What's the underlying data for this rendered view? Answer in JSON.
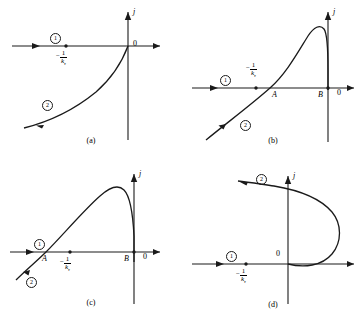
{
  "figure": {
    "axis_label_j": "j",
    "origin_label": "0",
    "branch_one": "①",
    "branch_two": "②",
    "tick_minus": "−",
    "tick_numerator": "1",
    "tick_denominator": "k",
    "tick_subscript": "τ",
    "point_a": "A",
    "point_b": "B",
    "line_color": "#1a1a1a",
    "background": "#ffffff"
  },
  "panels": [
    {
      "id": "a",
      "caption": "(a)",
      "curve_type": "monotonic-rise",
      "has_point_a": false,
      "has_point_b": false,
      "tick_label_position": "below"
    },
    {
      "id": "b",
      "caption": "(b)",
      "curve_type": "n-shaped-peak",
      "has_point_a": true,
      "has_point_b": true,
      "tick_label_position": "above"
    },
    {
      "id": "c",
      "caption": "(c)",
      "curve_type": "n-shaped-peak",
      "has_point_a": true,
      "has_point_b": true,
      "tick_label_position": "below"
    },
    {
      "id": "d",
      "caption": "(d)",
      "curve_type": "c-shaped-loop",
      "has_point_a": false,
      "has_point_b": false,
      "tick_label_position": "below"
    }
  ],
  "chart_data": {
    "type": "line",
    "title": "",
    "xlabel": "",
    "ylabel": "j",
    "grid": false,
    "legend": "none",
    "panels": [
      {
        "id": "a",
        "caption": "(a)",
        "description": "Current density rises monotonically from lower-left, approaching zero at the origin.",
        "branches": [
          {
            "name": "①",
            "kind": "horizontal-axis-branch",
            "points": [
              [
                -1.0,
                0.0
              ],
              [
                0.0,
                0.0
              ]
            ],
            "arrow_at": [
              -0.72,
              0.0
            ]
          },
          {
            "name": "②",
            "kind": "curve",
            "points": [
              [
                -0.93,
                -0.74
              ],
              [
                -0.78,
                -0.62
              ],
              [
                -0.6,
                -0.5
              ],
              [
                -0.42,
                -0.38
              ],
              [
                -0.26,
                -0.26
              ],
              [
                -0.13,
                -0.14
              ],
              [
                -0.05,
                -0.05
              ],
              [
                0.0,
                0.0
              ]
            ],
            "arrow_at": [
              -0.72,
              -0.58
            ]
          }
        ],
        "markers": [
          {
            "label": "−1/kτ",
            "x": -0.45,
            "y": 0.0,
            "position": "below"
          },
          {
            "label": "0",
            "x": 0.0,
            "y": 0.0,
            "position": "right"
          }
        ]
      },
      {
        "id": "b",
        "caption": "(b)",
        "description": "N-shaped curve crossing the axis at A, peaking, then dropping steeply to B near the origin.",
        "branches": [
          {
            "name": "①",
            "kind": "horizontal-axis-branch",
            "points": [
              [
                -1.0,
                0.0
              ],
              [
                0.0,
                0.0
              ]
            ],
            "arrow_at": [
              -0.8,
              0.0
            ]
          },
          {
            "name": "②",
            "kind": "curve",
            "points": [
              [
                -0.95,
                -0.72
              ],
              [
                -0.78,
                -0.55
              ],
              [
                -0.6,
                -0.36
              ],
              [
                -0.46,
                -0.18
              ],
              [
                -0.36,
                0.0
              ],
              [
                -0.22,
                0.3
              ],
              [
                -0.12,
                0.62
              ],
              [
                -0.05,
                0.82
              ],
              [
                0.0,
                0.88
              ],
              [
                0.04,
                0.84
              ],
              [
                0.07,
                0.6
              ],
              [
                0.08,
                0.22
              ],
              [
                0.08,
                0.0
              ]
            ],
            "arrow_at": [
              -0.72,
              -0.48
            ]
          }
        ],
        "markers": [
          {
            "label": "−1/kτ",
            "x": -0.52,
            "y": 0.0,
            "position": "above"
          },
          {
            "label": "A",
            "x": -0.36,
            "y": 0.0,
            "position": "below"
          },
          {
            "label": "B",
            "x": 0.08,
            "y": 0.0,
            "position": "below-left"
          },
          {
            "label": "0",
            "x": 0.18,
            "y": 0.0,
            "position": "below-right"
          }
        ]
      },
      {
        "id": "c",
        "caption": "(c)",
        "description": "N-shaped curve crossing the axis at A left of the tick, peaking, then dropping steeply to B near the origin.",
        "branches": [
          {
            "name": "①",
            "kind": "horizontal-axis-branch",
            "points": [
              [
                -1.0,
                0.0
              ],
              [
                0.0,
                0.0
              ]
            ],
            "arrow_at": [
              -0.82,
              0.0
            ]
          },
          {
            "name": "②",
            "kind": "curve",
            "points": [
              [
                -0.95,
                -0.34
              ],
              [
                -0.86,
                -0.22
              ],
              [
                -0.76,
                -0.08
              ],
              [
                -0.7,
                0.0
              ],
              [
                -0.52,
                0.28
              ],
              [
                -0.34,
                0.58
              ],
              [
                -0.18,
                0.8
              ],
              [
                -0.08,
                0.88
              ],
              [
                0.0,
                0.86
              ],
              [
                0.05,
                0.7
              ],
              [
                0.08,
                0.34
              ],
              [
                0.08,
                0.0
              ],
              [
                0.08,
                -0.1
              ]
            ],
            "arrow_at": [
              -0.88,
              -0.24
            ]
          }
        ],
        "markers": [
          {
            "label": "A",
            "x": -0.7,
            "y": 0.0,
            "position": "below"
          },
          {
            "label": "−1/kτ",
            "x": -0.48,
            "y": 0.0,
            "position": "below"
          },
          {
            "label": "B",
            "x": 0.08,
            "y": 0.0,
            "position": "below-left"
          },
          {
            "label": "0",
            "x": 0.2,
            "y": 0.0,
            "position": "below-right"
          }
        ]
      },
      {
        "id": "d",
        "caption": "(d)",
        "description": "C-shaped curve starting at the origin, bulging to the right, then looping back to the upper left.",
        "branches": [
          {
            "name": "①",
            "kind": "horizontal-axis-branch",
            "points": [
              [
                -1.0,
                0.0
              ],
              [
                0.0,
                0.0
              ]
            ],
            "arrow_at": [
              -0.7,
              0.0
            ]
          },
          {
            "name": "②",
            "kind": "curve",
            "points": [
              [
                0.0,
                0.0
              ],
              [
                0.22,
                -0.04
              ],
              [
                0.44,
                0.02
              ],
              [
                0.6,
                0.18
              ],
              [
                0.66,
                0.4
              ],
              [
                0.6,
                0.62
              ],
              [
                0.44,
                0.78
              ],
              [
                0.22,
                0.88
              ],
              [
                0.0,
                0.94
              ],
              [
                -0.24,
                0.98
              ],
              [
                -0.46,
                1.0
              ]
            ],
            "arrow_at": [
              -0.3,
              0.99
            ]
          }
        ],
        "markers": [
          {
            "label": "−1/kτ",
            "x": -0.42,
            "y": 0.0,
            "position": "below"
          },
          {
            "label": "0",
            "x": 0.0,
            "y": 0.0,
            "position": "above-left"
          }
        ]
      }
    ]
  }
}
